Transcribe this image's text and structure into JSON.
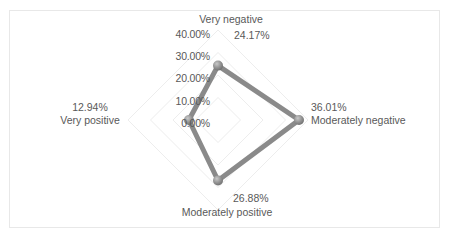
{
  "chart_data": {
    "type": "radar",
    "title": "",
    "categories": [
      "Very negative",
      "Moderately negative",
      "Moderately positive",
      "Very positive"
    ],
    "values": [
      24.17,
      36.01,
      26.88,
      12.94
    ],
    "value_labels": [
      "24.17%",
      "36.01%",
      "26.88%",
      "12.94%"
    ],
    "axis_ticks": [
      "0.00%",
      "10.00%",
      "20.00%",
      "30.00%",
      "40.00%"
    ],
    "axis_tick_values": [
      0,
      10,
      20,
      30,
      40
    ],
    "rlim": [
      0,
      40
    ],
    "grid": true,
    "legend": "none",
    "xlabel": "",
    "ylabel": "",
    "series_name": "",
    "unit": "%"
  },
  "style": {
    "series_color": "#808080",
    "marker_color": "#8c8c8c",
    "grid_color": "#ededed",
    "border_color": "#e8e8e8",
    "text_color": "#595959",
    "background": "#ffffff"
  },
  "axis_labels": {
    "tick_0": "0.00%",
    "tick_10": "10.00%",
    "tick_20": "20.00%",
    "tick_30": "30.00%",
    "tick_40": "40.00%"
  },
  "categories": {
    "top": {
      "name": "Very negative",
      "value": "24.17%"
    },
    "right": {
      "name": "Moderately negative",
      "value": "36.01%"
    },
    "bottom": {
      "name": "Moderately positive",
      "value": "26.88%"
    },
    "left": {
      "name": "Very positive",
      "value": "12.94%"
    }
  }
}
